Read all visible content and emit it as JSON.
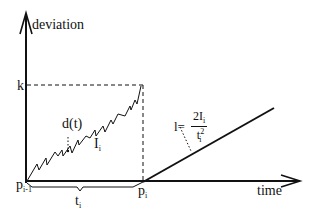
{
  "diagram": {
    "axes": {
      "y_label": "deviation",
      "x_label": "time"
    },
    "threshold": {
      "label": "k"
    },
    "curve": {
      "label": "d(t)"
    },
    "area": {
      "label_main": "I",
      "label_sub": "i"
    },
    "points": {
      "start": {
        "main": "p",
        "sub": "i-1"
      },
      "end": {
        "main": "p",
        "sub": "i"
      }
    },
    "interval": {
      "main": "t",
      "sub": "i"
    },
    "line_formula": {
      "lhs": "l=",
      "numerator_main": "2I",
      "numerator_sub": "i",
      "denominator_main": "t",
      "denominator_sub": "i",
      "denominator_sup": "2"
    },
    "colors": {
      "stroke": "#111111",
      "background": "#ffffff"
    }
  }
}
